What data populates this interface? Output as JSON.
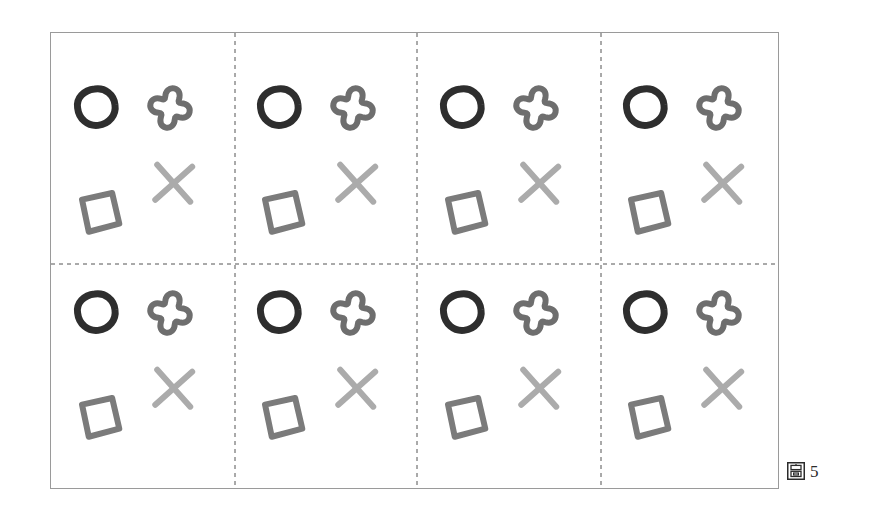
{
  "figure": {
    "panel_name": "shape-pattern-panel",
    "background_color": "#ffffff",
    "border_color": "#9a9a9a",
    "panel_rect": {
      "x": 50,
      "y": 32,
      "width": 729,
      "height": 457
    }
  },
  "caption": {
    "glyph": "圖",
    "glyph_name": "figure-label-cjk-glyph",
    "number": "5",
    "text": "圖 5"
  },
  "grid": {
    "style": "dashed",
    "color": "#555555",
    "dash": "4 4",
    "stroke_width": 1,
    "vertical_lines_x": [
      184,
      366,
      550
    ],
    "horizontal_lines_y": [
      231
    ],
    "origin_marker": "intersection"
  },
  "palette": {
    "near_black": "#1d1d1d",
    "dark_gray": "#3d3d3d",
    "medium_gray": "#7b7b7b",
    "light_gray": "#a8a8a8",
    "border_gray": "#9a9a9a"
  },
  "pattern": {
    "description": "hand-drawn repeating motif tiling",
    "tile_width": 183,
    "tile_height": 205,
    "stroke_linecap": "round",
    "stroke_linejoin": "round",
    "motifs": [
      {
        "name": "circle",
        "color": "#2e2e2e",
        "stroke_width": 7,
        "count_per_tile": 1
      },
      {
        "name": "plus-flower",
        "color": "#6e6e6e",
        "stroke_width": 6,
        "count_per_tile": 1
      },
      {
        "name": "x-mark",
        "color": "#ababab",
        "stroke_width": 6,
        "count_per_tile": 1
      },
      {
        "name": "tilted-square",
        "color": "#7b7b7b",
        "stroke_width": 6,
        "count_per_tile": 1
      },
      {
        "name": "left-triangle",
        "color": "#1d1d1d",
        "stroke_width": 7,
        "count_per_tile": 1
      }
    ]
  }
}
